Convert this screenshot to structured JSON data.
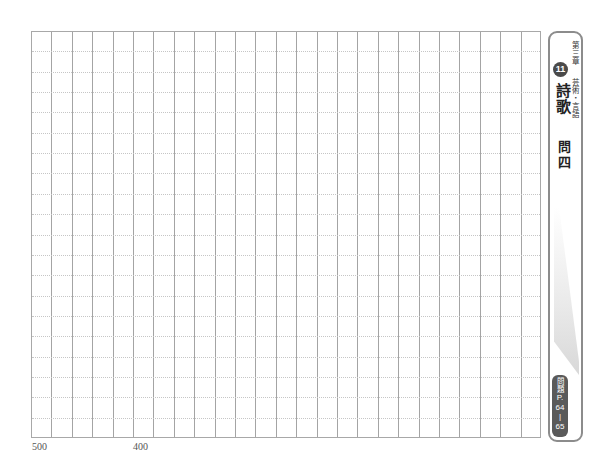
{
  "manuscript": {
    "columns": 25,
    "rows": 20,
    "char_counters": [
      {
        "label": "500",
        "column_index": 0
      },
      {
        "label": "400",
        "column_index": 5
      }
    ],
    "colors": {
      "column_line": "#a4a4a4",
      "row_dotted_line": "#c6c6c6"
    }
  },
  "sidebar": {
    "chapter": "第三章",
    "subject": "芸術・言語",
    "unit_number": "11",
    "title": "詩歌",
    "question": "問四",
    "reference_badge": {
      "label": "問題",
      "page_prefix": "P.",
      "page_start": "64",
      "separator": "|",
      "page_end": "65"
    },
    "colors": {
      "border": "#8c8c8c",
      "circle_bg": "#4a4a4a",
      "badge_bg": "#5a5a5a"
    }
  }
}
